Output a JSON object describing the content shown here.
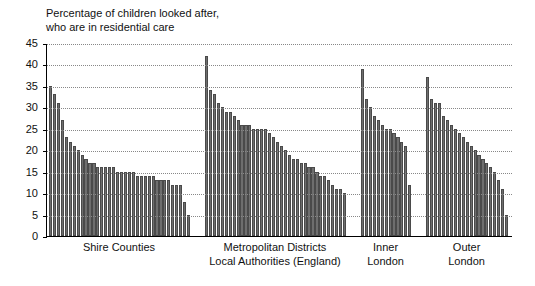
{
  "chart_data": {
    "type": "bar",
    "title": "Percentage of children looked after,\nwho are in residential care",
    "xlabel": "Local Authorities (England)",
    "ylabel": "",
    "ylim": [
      0,
      45
    ],
    "yticks": [
      0,
      5,
      10,
      15,
      20,
      25,
      30,
      35,
      40,
      45
    ],
    "ytick_labels": [
      "0",
      "5",
      "10",
      "15",
      "20",
      "25",
      "30",
      "35",
      "40",
      "45"
    ],
    "grid": true,
    "legend": "none",
    "bar_color": "#6e6e6e",
    "groups": [
      {
        "name": "Shire Counties",
        "label": "Shire Counties",
        "values": [
          35,
          33,
          31,
          27,
          23,
          22,
          21,
          20,
          19,
          18,
          17,
          17,
          16,
          16,
          16,
          16,
          16,
          15,
          15,
          15,
          15,
          15,
          14,
          14,
          14,
          14,
          14,
          13,
          13,
          13,
          13,
          12,
          12,
          12,
          8,
          5
        ]
      },
      {
        "name": "Metropolitan Districts",
        "label": "Metropolitan Districts",
        "values": [
          42,
          34,
          33,
          31,
          30,
          29,
          29,
          28,
          27,
          26,
          26,
          26,
          25,
          25,
          25,
          25,
          24,
          23,
          22,
          21,
          20,
          19,
          18,
          18,
          17,
          17,
          16,
          16,
          15,
          14,
          14,
          13,
          12,
          11,
          11,
          10
        ]
      },
      {
        "name": "Inner London",
        "label": "Inner\nLondon",
        "values": [
          39,
          32,
          30,
          28,
          27,
          26,
          25,
          25,
          24,
          23,
          22,
          21,
          12
        ]
      },
      {
        "name": "Outer London",
        "label": "Outer\nLondon",
        "values": [
          37,
          32,
          31,
          31,
          28,
          27,
          26,
          25,
          24,
          23,
          22,
          21,
          20,
          19,
          18,
          17,
          16,
          15,
          13,
          11,
          5
        ]
      }
    ]
  }
}
